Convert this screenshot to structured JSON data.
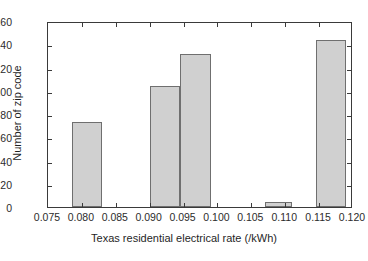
{
  "chart_data": {
    "type": "bar",
    "title": "",
    "subtitle": "",
    "xlabel": "Texas residential electrical rate (/kWh)",
    "ylabel": "Number of zip code",
    "xlim": [
      0.075,
      0.12
    ],
    "ylim": [
      0,
      160
    ],
    "grid": false,
    "legend": "none",
    "x_ticks": [
      0.075,
      0.08,
      0.085,
      0.09,
      0.095,
      0.1,
      0.105,
      0.11,
      0.115,
      0.12
    ],
    "x_tick_labels": [
      "0.075",
      "0.080",
      "0.085",
      "0.090",
      "0.095",
      "0.100",
      "0.105",
      "0.110",
      "0.115",
      "0.120"
    ],
    "y_ticks": [
      0,
      20,
      40,
      60,
      80,
      100,
      120,
      140,
      160
    ],
    "y_tick_labels": [
      "0",
      "20",
      "40",
      "60",
      "80",
      "100",
      "120",
      "140",
      "160"
    ],
    "bar_fill_color": "#d0d0d0",
    "bar_edge_color": "#6f6f6f",
    "axis_color": "#3a3a3a",
    "bins": [
      {
        "label": "0.0785-0.0830",
        "x_start": 0.0785,
        "x_end": 0.083,
        "value": 73
      },
      {
        "label": "0.0900-0.0945",
        "x_start": 0.09,
        "x_end": 0.0945,
        "value": 104
      },
      {
        "label": "0.0945-0.0990",
        "x_start": 0.0945,
        "x_end": 0.099,
        "value": 132
      },
      {
        "label": "0.1070-0.1110",
        "x_start": 0.107,
        "x_end": 0.111,
        "value": 4
      },
      {
        "label": "0.1145-0.1190",
        "x_start": 0.1145,
        "x_end": 0.119,
        "value": 144
      }
    ],
    "categories": [
      "0.0785-0.0830",
      "0.0900-0.0945",
      "0.0945-0.0990",
      "0.1070-0.1110",
      "0.1145-0.1190"
    ],
    "values": [
      73,
      104,
      132,
      4,
      144
    ]
  }
}
